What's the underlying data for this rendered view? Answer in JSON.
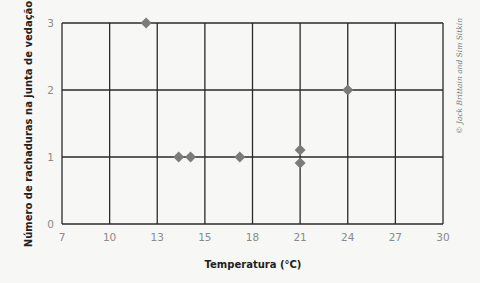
{
  "chart_data": {
    "type": "scatter",
    "title": "",
    "xlabel": "Temperatura (°C)",
    "ylabel": "Número de rachaduras na junta de vedação",
    "x_tick_labels": [
      "7",
      "10",
      "13",
      "15",
      "18",
      "21",
      "24",
      "27",
      "30"
    ],
    "y_tick_labels": [
      "0",
      "1",
      "2",
      "3"
    ],
    "xlim": [
      7,
      30
    ],
    "ylim": [
      0,
      3
    ],
    "grid": true,
    "legend": null,
    "points": [
      {
        "x": 12.3,
        "y": 3
      },
      {
        "x": 13.9,
        "y": 1
      },
      {
        "x": 14.4,
        "y": 1
      },
      {
        "x": 17.2,
        "y": 1
      },
      {
        "x": 21,
        "y": 1,
        "note": "stacked above"
      },
      {
        "x": 21,
        "y": 1,
        "note": "stacked below"
      },
      {
        "x": 24,
        "y": 2
      }
    ],
    "marker": "diamond",
    "marker_color": "#7b7b7b",
    "annotations": [
      "© Jack Brittain and Sim Sitkin"
    ]
  },
  "labels": {
    "xlabel": "Temperatura (°C)",
    "ylabel": "Número de rachaduras na junta de vedação",
    "credit": "© Jack Brittain and Sim Sitkin"
  }
}
